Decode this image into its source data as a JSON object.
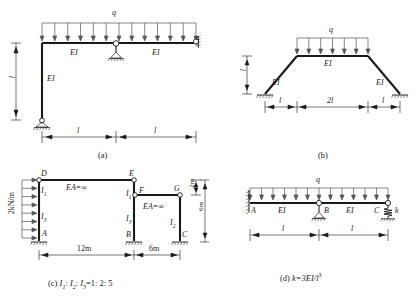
{
  "figure": {
    "panels": [
      {
        "id": "a",
        "caption": "(a)",
        "load_label": "q",
        "members": [
          {
            "name": "left-beam-stiffness",
            "label": "EI"
          },
          {
            "name": "right-beam-stiffness",
            "label": "EI"
          },
          {
            "name": "column-stiffness",
            "label": "EI"
          }
        ],
        "dimensions": [
          {
            "name": "column-height",
            "label": "l"
          },
          {
            "name": "left-span",
            "label": "l"
          },
          {
            "name": "right-span",
            "label": "l"
          }
        ],
        "supports": [
          {
            "name": "base-roller-support",
            "type": "roller"
          },
          {
            "name": "mid-hinge-roller-support",
            "type": "hinge-roller"
          },
          {
            "name": "right-roller-support",
            "type": "roller"
          }
        ],
        "arrow_count": 13
      },
      {
        "id": "b",
        "caption": "(b)",
        "load_label": "q",
        "members": [
          {
            "name": "left-incline-stiffness",
            "label": "EI"
          },
          {
            "name": "top-beam-stiffness",
            "label": "EI"
          },
          {
            "name": "right-incline-stiffness",
            "label": "EI"
          }
        ],
        "dimensions": [
          {
            "name": "rise-height",
            "label": "l"
          },
          {
            "name": "left-offset",
            "label": "l"
          },
          {
            "name": "top-span",
            "label": "2l"
          },
          {
            "name": "right-offset",
            "label": "l"
          }
        ],
        "supports": [
          {
            "name": "left-fixed-support",
            "type": "hatched"
          },
          {
            "name": "right-fixed-support",
            "type": "hatched"
          }
        ],
        "arrow_count": 7
      },
      {
        "id": "c",
        "caption_prefix": "(c) ",
        "caption_ratio": "I1: I2: I3=1: 2: 5",
        "caption_parts": {
          "i1": "I",
          "i1s": "1",
          "sep1": ": ",
          "i2": "I",
          "i2s": "2",
          "sep2": ": ",
          "i3": "I",
          "i3s": "3",
          "eq": "=1: 2: 5"
        },
        "load_label": "2kN/m",
        "nodes": [
          {
            "name": "node-D",
            "label": "D"
          },
          {
            "name": "node-A",
            "label": "A"
          },
          {
            "name": "node-E",
            "label": "E"
          },
          {
            "name": "node-F",
            "label": "F"
          },
          {
            "name": "node-G",
            "label": "G"
          },
          {
            "name": "node-B",
            "label": "B"
          },
          {
            "name": "node-C",
            "label": "C"
          }
        ],
        "members": [
          {
            "name": "upper-beam-axial",
            "label": "EA=∞"
          },
          {
            "name": "lower-beam-axial",
            "label": "EA=∞"
          },
          {
            "name": "left-upper-column",
            "label": "I",
            "sub": "1"
          },
          {
            "name": "left-lower-column",
            "label": "I",
            "sub": "3"
          },
          {
            "name": "mid-upper-column",
            "label": "I",
            "sub": "1"
          },
          {
            "name": "mid-lower-column",
            "label": "I",
            "sub": "3"
          },
          {
            "name": "right-column",
            "label": "I",
            "sub": "2"
          }
        ],
        "dimensions": [
          {
            "name": "left-bay-width",
            "label": "12m"
          },
          {
            "name": "right-bay-width",
            "label": "6m"
          },
          {
            "name": "top-offset-height",
            "label": "2m"
          },
          {
            "name": "right-column-height",
            "label": "6m"
          }
        ],
        "supports": [
          {
            "name": "support-A-fixed",
            "type": "hatched"
          },
          {
            "name": "support-B-fixed",
            "type": "hatched"
          },
          {
            "name": "support-C-fixed",
            "type": "hatched"
          }
        ]
      },
      {
        "id": "d",
        "caption_prefix": "(d) ",
        "caption_formula_a": "k=3EI/l",
        "caption_formula_sup": "3",
        "load_label": "q",
        "nodes": [
          {
            "name": "node-A",
            "label": "A"
          },
          {
            "name": "node-B",
            "label": "B"
          },
          {
            "name": "node-C",
            "label": "C"
          }
        ],
        "members": [
          {
            "name": "left-span-stiffness",
            "label": "EI"
          },
          {
            "name": "right-span-stiffness",
            "label": "EI"
          }
        ],
        "spring": {
          "name": "spring-k",
          "label": "k"
        },
        "dimensions": [
          {
            "name": "left-span",
            "label": "l"
          },
          {
            "name": "right-span",
            "label": "l"
          }
        ],
        "supports": [
          {
            "name": "support-A-fixed",
            "type": "vertical-hatch"
          },
          {
            "name": "support-B-roller",
            "type": "hinge-roller"
          },
          {
            "name": "support-C-spring",
            "type": "spring"
          }
        ],
        "arrow_count": 13
      }
    ],
    "colors": {
      "line": "#1a1a1a",
      "thin": "#555555",
      "background": "#ffffff"
    }
  }
}
